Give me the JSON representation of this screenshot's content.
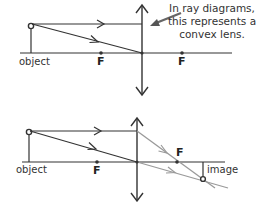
{
  "annotation": {
    "line1": "In ray diagrams,",
    "line2": "this represents a",
    "line3": "convex lens."
  },
  "top_diagram": {
    "object_label": "object",
    "focal_left": "F",
    "focal_right": "F"
  },
  "bottom_diagram": {
    "object_label": "object",
    "focal_left": "F",
    "focal_right": "F",
    "image_label": "image"
  },
  "colors": {
    "ray_dark": "#333333",
    "ray_light": "#9a9a9a",
    "pointer_arrow": "#555555"
  }
}
